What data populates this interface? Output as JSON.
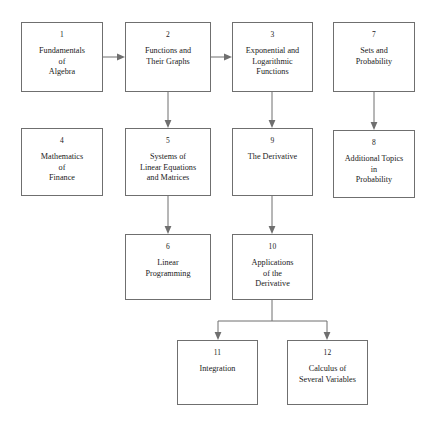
{
  "diagram": {
    "type": "flowchart",
    "orientation": "top-to-bottom",
    "background_color": "#ffffff",
    "line_color": "#6f6f6f",
    "text_color": "#1a1a1a",
    "nodes": [
      {
        "id": "ch1",
        "number": "1",
        "title": "Fundamentals\nof\nAlgebra",
        "x": 21,
        "y": 22,
        "w": 82,
        "h": 70
      },
      {
        "id": "ch2",
        "number": "2",
        "title": "Functions and\nTheir Graphs",
        "x": 125,
        "y": 22,
        "w": 86,
        "h": 70
      },
      {
        "id": "ch3",
        "number": "3",
        "title": "Exponential and\nLogarithmic\nFunctions",
        "x": 232,
        "y": 22,
        "w": 81,
        "h": 70
      },
      {
        "id": "ch7",
        "number": "7",
        "title": "Sets and\nProbability",
        "x": 333,
        "y": 22,
        "w": 82,
        "h": 70
      },
      {
        "id": "ch4",
        "number": "4",
        "title": "Mathematics\nof\nFinance",
        "x": 21,
        "y": 128,
        "w": 82,
        "h": 68
      },
      {
        "id": "ch5",
        "number": "5",
        "title": "Systems of\nLinear Equations\nand Matrices",
        "x": 125,
        "y": 128,
        "w": 86,
        "h": 68
      },
      {
        "id": "ch9",
        "number": "9",
        "title": "The Derivative",
        "x": 232,
        "y": 128,
        "w": 81,
        "h": 68
      },
      {
        "id": "ch8",
        "number": "8",
        "title": "Additional Topics\nin\nProbability",
        "x": 333,
        "y": 130,
        "w": 82,
        "h": 68
      },
      {
        "id": "ch6",
        "number": "6",
        "title": "Linear\nProgramming",
        "x": 125,
        "y": 234,
        "w": 86,
        "h": 66
      },
      {
        "id": "ch10",
        "number": "10",
        "title": "Applications\nof the\nDerivative",
        "x": 232,
        "y": 234,
        "w": 81,
        "h": 66
      },
      {
        "id": "ch11",
        "number": "11",
        "title": "Integration",
        "x": 177,
        "y": 340,
        "w": 81,
        "h": 65
      },
      {
        "id": "ch12",
        "number": "12",
        "title": "Calculus of\nSeveral Variables",
        "x": 287,
        "y": 340,
        "w": 81,
        "h": 65
      }
    ],
    "edges": [
      {
        "from": "ch1",
        "to": "ch2",
        "style": "horizontal-arrow"
      },
      {
        "from": "ch2",
        "to": "ch3",
        "style": "horizontal-arrow"
      },
      {
        "from": "ch2",
        "to": "ch5",
        "style": "vertical-arrow"
      },
      {
        "from": "ch3",
        "to": "ch9",
        "style": "vertical-arrow"
      },
      {
        "from": "ch7",
        "to": "ch8",
        "style": "vertical-arrow"
      },
      {
        "from": "ch5",
        "to": "ch6",
        "style": "vertical-arrow"
      },
      {
        "from": "ch9",
        "to": "ch10",
        "style": "vertical-arrow"
      },
      {
        "from": "ch10",
        "to": "ch11",
        "style": "split-arrow"
      },
      {
        "from": "ch10",
        "to": "ch12",
        "style": "split-arrow"
      }
    ]
  }
}
